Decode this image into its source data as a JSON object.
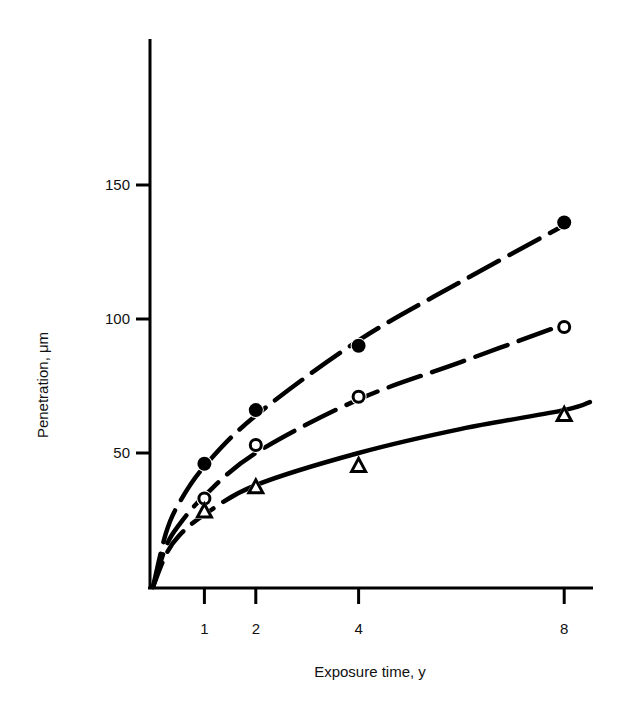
{
  "chart_data": {
    "type": "line",
    "title": "",
    "xlabel": "Exposure time, y",
    "ylabel": "Penetration, μm",
    "x": [
      1,
      2,
      4,
      8
    ],
    "xticks": [
      1,
      2,
      4,
      8
    ],
    "yticks": [
      50,
      100,
      150
    ],
    "xlim": [
      0,
      8.5
    ],
    "ylim": [
      0,
      200
    ],
    "grid": false,
    "legend": "none",
    "series": [
      {
        "name": "filled circles",
        "marker": "filled-circle",
        "values": [
          46,
          66,
          90,
          136
        ]
      },
      {
        "name": "open circles",
        "marker": "open-circle",
        "values": [
          33,
          53,
          71,
          97
        ]
      },
      {
        "name": "open triangles",
        "marker": "open-triangle",
        "values": [
          28,
          37,
          45,
          64
        ]
      }
    ],
    "fit_curves": [
      {
        "series": "filled circles",
        "style": "dashed",
        "points": [
          [
            0,
            0
          ],
          [
            0.25,
            20
          ],
          [
            0.5,
            31
          ],
          [
            1,
            45
          ],
          [
            2,
            64
          ],
          [
            4,
            92
          ],
          [
            6,
            114
          ],
          [
            8,
            135
          ]
        ]
      },
      {
        "series": "open circles",
        "style": "dashed",
        "points": [
          [
            0,
            0
          ],
          [
            0.25,
            15
          ],
          [
            0.5,
            23
          ],
          [
            1,
            34
          ],
          [
            2,
            50
          ],
          [
            4,
            70
          ],
          [
            6,
            84
          ],
          [
            8,
            98
          ]
        ]
      },
      {
        "series": "open triangles",
        "style": "dashed-then-solid",
        "points": [
          [
            0,
            0
          ],
          [
            0.25,
            12
          ],
          [
            0.5,
            19
          ],
          [
            1,
            27
          ],
          [
            2,
            38
          ],
          [
            4,
            50
          ],
          [
            6,
            59
          ],
          [
            8,
            66
          ],
          [
            8.5,
            69
          ]
        ]
      }
    ]
  }
}
